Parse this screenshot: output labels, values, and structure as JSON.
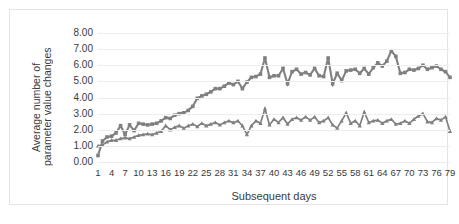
{
  "chart_data": {
    "type": "line",
    "title": "",
    "xlabel": "Subsequent days",
    "ylabel": "Average number of parameter value changes",
    "ylabel_line1": "Average number of",
    "ylabel_line2": "parameter value changes",
    "ylim": [
      0,
      8
    ],
    "ytick_labels": [
      "8.00",
      "7.00",
      "6.00",
      "5.00",
      "4.00",
      "3.00",
      "2.00",
      "1.00",
      "0.00"
    ],
    "ytick_values": [
      8,
      7,
      6,
      5,
      4,
      3,
      2,
      1,
      0
    ],
    "xlim": [
      1,
      79
    ],
    "grid": "horizontal",
    "legend": "none",
    "series_color": "#808080",
    "x": [
      1,
      2,
      3,
      4,
      5,
      6,
      7,
      8,
      9,
      10,
      11,
      12,
      13,
      14,
      15,
      16,
      17,
      18,
      19,
      20,
      21,
      22,
      23,
      24,
      25,
      26,
      27,
      28,
      29,
      30,
      31,
      32,
      33,
      34,
      35,
      36,
      37,
      38,
      39,
      40,
      41,
      42,
      43,
      44,
      45,
      46,
      47,
      48,
      49,
      50,
      51,
      52,
      53,
      54,
      55,
      56,
      57,
      58,
      59,
      60,
      61,
      62,
      63,
      64,
      65,
      66,
      67,
      68,
      69,
      70,
      71,
      72,
      73,
      74,
      75,
      76,
      77,
      78,
      79
    ],
    "xtick_labels": [
      "1",
      "4",
      "7",
      "10",
      "13",
      "16",
      "19",
      "22",
      "25",
      "28",
      "31",
      "34",
      "37",
      "40",
      "43",
      "46",
      "49",
      "52",
      "55",
      "58",
      "61",
      "64",
      "67",
      "70",
      "73",
      "76",
      "79"
    ],
    "xtick_values": [
      1,
      4,
      7,
      10,
      13,
      16,
      19,
      22,
      25,
      28,
      31,
      34,
      37,
      40,
      43,
      46,
      49,
      52,
      55,
      58,
      61,
      64,
      67,
      70,
      73,
      76,
      79
    ],
    "series": [
      {
        "name": "squares",
        "marker": "square",
        "values": [
          0.4,
          1.3,
          1.55,
          1.6,
          1.8,
          2.25,
          1.7,
          2.3,
          1.95,
          2.4,
          2.35,
          2.3,
          2.35,
          2.4,
          2.55,
          2.75,
          2.7,
          2.9,
          3.0,
          3.05,
          3.2,
          3.45,
          3.95,
          4.1,
          4.2,
          4.35,
          4.55,
          4.55,
          4.7,
          4.9,
          4.8,
          5.0,
          4.55,
          4.95,
          5.25,
          5.3,
          5.45,
          6.45,
          5.25,
          5.35,
          5.35,
          5.8,
          4.85,
          5.6,
          5.75,
          5.45,
          5.55,
          5.4,
          5.8,
          5.35,
          5.3,
          6.45,
          4.85,
          5.5,
          5.05,
          5.65,
          5.7,
          5.75,
          5.5,
          5.8,
          5.45,
          5.85,
          6.15,
          5.95,
          6.25,
          6.9,
          6.55,
          5.5,
          5.55,
          5.75,
          5.7,
          5.8,
          6.0,
          5.75,
          5.85,
          5.95,
          5.75,
          5.6,
          5.25
        ]
      },
      {
        "name": "triangles",
        "marker": "triangle",
        "values": [
          1.0,
          1.05,
          1.25,
          1.35,
          1.35,
          1.45,
          1.5,
          1.45,
          1.55,
          1.65,
          1.7,
          1.75,
          1.7,
          1.8,
          1.9,
          2.25,
          2.0,
          2.15,
          2.25,
          2.1,
          2.25,
          2.35,
          2.2,
          2.4,
          2.25,
          2.35,
          2.45,
          2.3,
          2.45,
          2.55,
          2.45,
          2.55,
          2.25,
          1.7,
          2.25,
          2.55,
          2.4,
          3.3,
          2.3,
          2.65,
          2.45,
          2.75,
          2.35,
          2.65,
          2.75,
          2.6,
          2.8,
          2.6,
          2.8,
          2.45,
          2.55,
          2.75,
          2.3,
          2.1,
          2.55,
          3.05,
          2.4,
          2.55,
          2.25,
          3.1,
          2.45,
          2.55,
          2.6,
          2.4,
          2.55,
          2.65,
          2.35,
          2.4,
          2.55,
          2.4,
          2.65,
          2.85,
          3.0,
          2.5,
          2.45,
          2.7,
          2.6,
          2.8,
          1.9
        ]
      }
    ]
  }
}
